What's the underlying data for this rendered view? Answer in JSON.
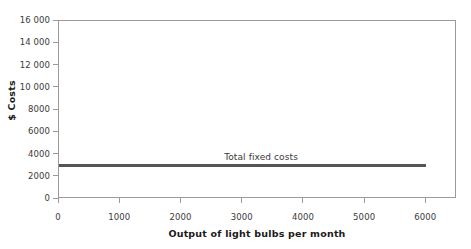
{
  "chart_data": {
    "type": "line",
    "title": "",
    "xlabel": "Output of light bulbs per month",
    "ylabel": "$ Costs",
    "xlim": [
      0,
      6500
    ],
    "ylim": [
      0,
      16000
    ],
    "grid": false,
    "legend_position": "inline-annotation",
    "xticks": [
      0,
      1000,
      2000,
      3000,
      4000,
      5000,
      6000
    ],
    "xticklabels": [
      "0",
      "1000",
      "2000",
      "3000",
      "4000",
      "5000",
      "6000"
    ],
    "yticks": [
      0,
      2000,
      4000,
      6000,
      8000,
      10000,
      12000,
      14000,
      16000
    ],
    "yticklabels": [
      "0",
      "2000",
      "4000",
      "6000",
      "8000",
      "10 000",
      "12 000",
      "14 000",
      "16 000"
    ],
    "series": [
      {
        "name": "Total fixed costs",
        "color": "#555555",
        "x": [
          0,
          1000,
          2000,
          3000,
          4000,
          5000,
          6000
        ],
        "values": [
          3000,
          3000,
          3000,
          3000,
          3000,
          3000,
          3000
        ]
      }
    ],
    "annotations": [
      {
        "text": "Total fixed costs",
        "x": 3300,
        "y": 3700
      }
    ]
  },
  "axes": {
    "y_title": "$ Costs",
    "x_title": "Output of light bulbs per month"
  },
  "colors": {
    "line": "#555555",
    "frame": "#9a9a9a",
    "tick_text": "#3a3a3a",
    "title_text": "#1a1a1a",
    "background": "#ffffff"
  }
}
